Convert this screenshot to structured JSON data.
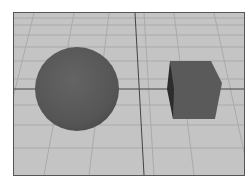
{
  "scene": {
    "label": "3D viewport",
    "objects": [
      {
        "type": "sphere",
        "label": "sphere"
      },
      {
        "type": "cube",
        "label": "cube"
      }
    ],
    "colors": {
      "floor": "#c4c4c4",
      "grid": "#a8a8a8",
      "axis": "#444444",
      "object": "#5a5a5a",
      "border": "#555555"
    }
  }
}
